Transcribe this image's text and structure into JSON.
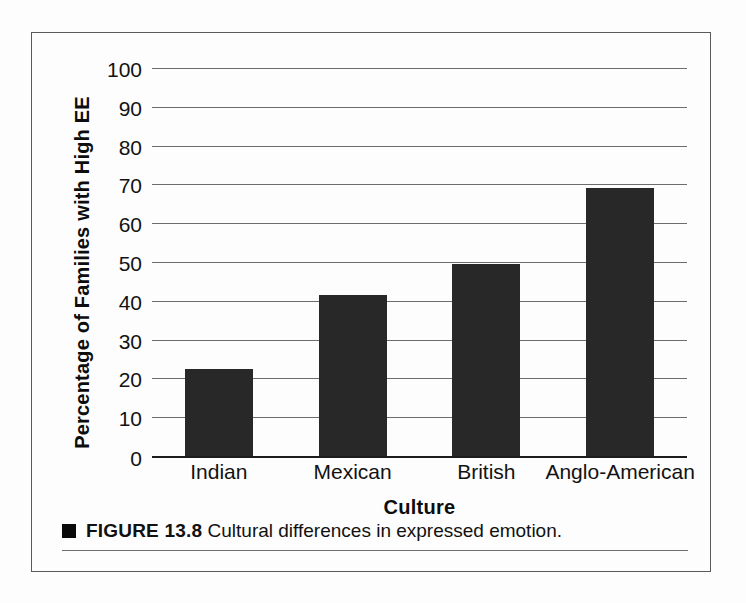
{
  "figure": {
    "caption_bullet": "black-square",
    "caption_figure_no": "FIGURE 13.8",
    "caption_text": "Cultural differences in expressed emotion."
  },
  "chart_data": {
    "type": "bar",
    "title": "",
    "xlabel": "Culture",
    "ylabel": "Percentage of Families with High EE",
    "categories": [
      "Indian",
      "Mexican",
      "British",
      "Anglo-American"
    ],
    "values": [
      22.5,
      41.5,
      49.5,
      69
    ],
    "ylim": [
      0,
      100
    ],
    "yticks": [
      0,
      10,
      20,
      30,
      40,
      50,
      60,
      70,
      80,
      90,
      100
    ],
    "ytick_labels": [
      "0",
      "10",
      "20",
      "30",
      "40",
      "50",
      "60",
      "70",
      "80",
      "90",
      "100"
    ],
    "grid": true,
    "legend": "none",
    "bar_color": "#282828",
    "gridline_color": "#6d6d6d",
    "axis_color": "#1c1c1c"
  }
}
